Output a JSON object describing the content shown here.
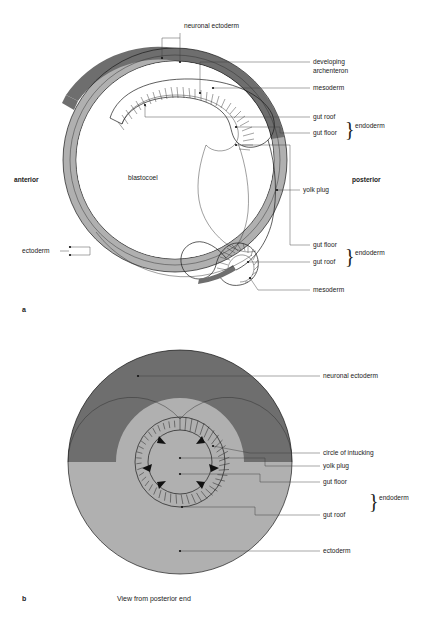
{
  "figure": {
    "colors": {
      "neuronal_ectoderm": "#6e6e6e",
      "ectoderm": "#b0b0b0",
      "mesoderm_band": "#8a8a8a",
      "background": "#ffffff",
      "line": "#1a1a1a",
      "leader": "#3a3a3a"
    }
  },
  "panel_a": {
    "letter": "a",
    "labels": {
      "neuronal_ectoderm": "neuronal ectoderm",
      "developing": "developing",
      "archenteron": "archenteron",
      "mesoderm_top": "mesoderm",
      "gut_roof_top": "gut roof",
      "gut_floor_top": "gut floor",
      "endoderm_top": "endoderm",
      "yolk_plug": "yolk plug",
      "gut_floor_bottom": "gut floor",
      "gut_roof_bottom": "gut roof",
      "endoderm_bottom": "endoderm",
      "mesoderm_bottom": "mesoderm",
      "ectoderm": "ectoderm",
      "anterior": "anterior",
      "posterior": "posterior",
      "blastocoel": "blastocoel"
    }
  },
  "panel_b": {
    "letter": "b",
    "caption": "View from posterior end",
    "labels": {
      "neuronal_ectoderm": "neuronal ectoderm",
      "circle_of_intucking": "circle of intucking",
      "yolk_plug": "yolk plug",
      "gut_floor": "gut floor",
      "gut_roof": "gut roof",
      "endoderm": "endoderm",
      "ectoderm": "ectoderm"
    }
  }
}
